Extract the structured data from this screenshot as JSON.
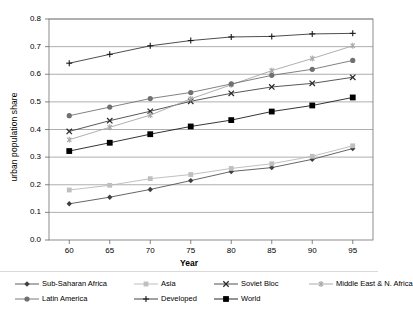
{
  "chart_data": {
    "type": "line",
    "title": "",
    "xlabel": "Year",
    "ylabel": "urban population share",
    "x": [
      60,
      65,
      70,
      75,
      80,
      85,
      90,
      95
    ],
    "xticklabels": [
      "60",
      "65",
      "70",
      "75",
      "80",
      "85",
      "90",
      "95"
    ],
    "yticklabels": [
      "0.0",
      "0.1",
      "0.2",
      "0.3",
      "0.4",
      "0.5",
      "0.6",
      "0.7",
      "0.8"
    ],
    "xlim": [
      57.5,
      97.5
    ],
    "ylim": [
      0.0,
      0.8
    ],
    "grid": "horizontal",
    "legend_position": "bottom",
    "series": [
      {
        "name": "Sub-Saharan Africa",
        "marker": "diamond",
        "color": "#3f3f3f",
        "line_color": "#4a4a4a",
        "values": [
          0.131,
          0.155,
          0.183,
          0.215,
          0.248,
          0.262,
          0.292,
          0.331
        ]
      },
      {
        "name": "Asia",
        "marker": "square",
        "color": "#bfbfbf",
        "line_color": "#b5b5b5",
        "values": [
          0.181,
          0.198,
          0.222,
          0.237,
          0.259,
          0.276,
          0.303,
          0.341
        ]
      },
      {
        "name": "Soviet Bloc",
        "marker": "x",
        "color": "#2b2b2b",
        "line_color": "#3a3a3a",
        "values": [
          0.393,
          0.432,
          0.466,
          0.502,
          0.531,
          0.554,
          0.567,
          0.589
        ]
      },
      {
        "name": "Middle East & N. Africa",
        "marker": "asterisk",
        "color": "#a6a6a6",
        "line_color": "#a0a0a0",
        "values": [
          0.363,
          0.408,
          0.452,
          0.511,
          0.562,
          0.613,
          0.657,
          0.703
        ]
      },
      {
        "name": "Latin America",
        "marker": "circle",
        "color": "#707070",
        "line_color": "#6b6b6b",
        "values": [
          0.45,
          0.481,
          0.512,
          0.534,
          0.565,
          0.596,
          0.618,
          0.65
        ]
      },
      {
        "name": "Developed",
        "marker": "plus",
        "color": "#1a1a1a",
        "line_color": "#2e2e2e",
        "values": [
          0.64,
          0.672,
          0.703,
          0.722,
          0.735,
          0.737,
          0.746,
          0.748
        ]
      },
      {
        "name": "World",
        "marker": "filled-square",
        "color": "#000000",
        "line_color": "#111111",
        "values": [
          0.322,
          0.352,
          0.383,
          0.411,
          0.434,
          0.465,
          0.487,
          0.516
        ]
      }
    ]
  },
  "axes": {
    "y_title": "urban population share",
    "x_title": "Year"
  },
  "legend": {
    "rows": [
      [
        "Sub-Saharan Africa",
        "Asia",
        "Soviet Bloc",
        "Middle East & N. Africa"
      ],
      [
        "Latin America",
        "Developed",
        "World"
      ]
    ]
  },
  "colors": {
    "plot_border": "#808080",
    "gridline": "#9a9a9a",
    "background": "#ffffff"
  }
}
